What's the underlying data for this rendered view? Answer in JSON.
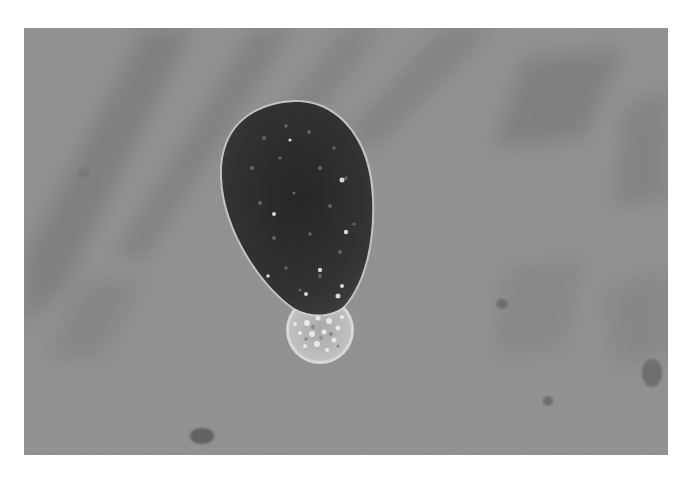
{
  "image": {
    "description": "Grayscale light micrograph: large dark oval cell with bright granules, small round granular cell attached at its lower end, mottled gray background with diagonal streaks",
    "colors": {
      "background": "#8f8f8f",
      "streak": "#6f6f6f",
      "cell_dark": "#2e2e2e",
      "cell_rim": "#c8c8c8",
      "small_cell": "#b8b8b8",
      "granule": "#e4e4e4"
    }
  }
}
